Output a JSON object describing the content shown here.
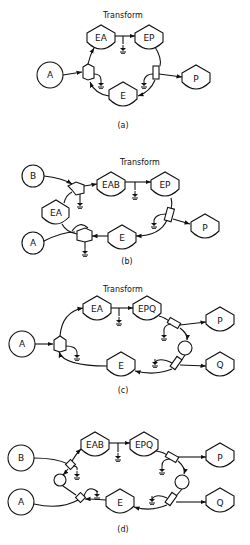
{
  "panels": [
    {
      "id": "a",
      "title": "Transform",
      "caption": "(a)",
      "nodes": {
        "A": "A",
        "EA": "EA",
        "EP": "EP",
        "E": "E",
        "P": "P"
      }
    },
    {
      "id": "b",
      "title": "Transform",
      "caption": "(b)",
      "nodes": {
        "B": "B",
        "A": "A",
        "EA": "EA",
        "EAB": "EAB",
        "EP": "EP",
        "E": "E",
        "P": "P"
      }
    },
    {
      "id": "c",
      "title": "Transform",
      "caption": "(c)",
      "nodes": {
        "A": "A",
        "EA": "EA",
        "EPQ": "EPQ",
        "E": "E",
        "P": "P",
        "Q": "Q"
      }
    },
    {
      "id": "d",
      "title": "",
      "caption": "(d)",
      "nodes": {
        "B": "B",
        "A": "A",
        "EAB": "EAB",
        "EPQ": "EPQ",
        "E": "E",
        "P": "P",
        "Q": "Q"
      }
    }
  ]
}
